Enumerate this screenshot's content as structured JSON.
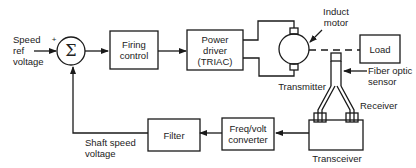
{
  "diagram": {
    "inputs": {
      "speed_ref": [
        "Speed",
        "ref",
        "voltage"
      ],
      "plus_sign": "+"
    },
    "summing_junction": {
      "symbol": "Σ"
    },
    "blocks": {
      "firing_control": [
        "Firing",
        "control"
      ],
      "power_driver": [
        "Power",
        "driver",
        "(TRIAC)"
      ],
      "load": "Load",
      "filter": "Filter",
      "freq_volt": [
        "Freq/volt",
        "converter"
      ]
    },
    "labels": {
      "induct_motor": [
        "Induct",
        "motor"
      ],
      "transmitter": "Transmitter",
      "fiber_optic": [
        "Fiber optic",
        "sensor"
      ],
      "receiver": "Receiver",
      "transceiver": "Transceiver",
      "shaft_speed": [
        "Shaft speed",
        "voltage"
      ]
    },
    "colors": {
      "line": "#1a1a1a",
      "text": "#222222",
      "background": "#ffffff"
    }
  }
}
